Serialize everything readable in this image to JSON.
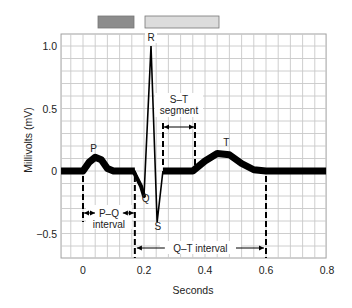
{
  "chart_data": {
    "type": "line",
    "title": "",
    "xlabel": "Seconds",
    "ylabel": "Millivolts (mV)",
    "xlim": [
      -0.072,
      0.797
    ],
    "ylim": [
      -0.696,
      1.096
    ],
    "grid": true,
    "x_ticks": [
      {
        "value": 0,
        "label": "0"
      },
      {
        "value": 0.2,
        "label": "0.2"
      },
      {
        "value": 0.4,
        "label": "0.4"
      },
      {
        "value": 0.6,
        "label": "0.6"
      },
      {
        "value": 0.8,
        "label": "0.8"
      }
    ],
    "y_ticks": [
      {
        "value": 1.0,
        "label": "1.0"
      },
      {
        "value": 0.5,
        "label": "0.5"
      },
      {
        "value": 0,
        "label": "0"
      },
      {
        "value": -0.5,
        "label": "−0.5"
      }
    ],
    "series": [
      {
        "name": "ECG trace",
        "x": [
          -0.072,
          0.0,
          0.02,
          0.04,
          0.06,
          0.08,
          0.1,
          0.17,
          0.2,
          0.223,
          0.243,
          0.262,
          0.27,
          0.36,
          0.4,
          0.44,
          0.48,
          0.52,
          0.56,
          0.6,
          0.797
        ],
        "y": [
          0,
          0,
          0.07,
          0.11,
          0.09,
          0.02,
          0,
          0,
          -0.2,
          1.0,
          -0.41,
          0,
          0,
          0,
          0.08,
          0.14,
          0.13,
          0.06,
          0.01,
          0,
          0
        ]
      }
    ],
    "wave_labels": [
      {
        "label": "P",
        "x": 0.035,
        "y": 0.15
      },
      {
        "label": "Q",
        "x": 0.205,
        "y": -0.25
      },
      {
        "label": "R",
        "x": 0.223,
        "y": 1.04
      },
      {
        "label": "S",
        "x": 0.245,
        "y": -0.47
      },
      {
        "label": "T",
        "x": 0.47,
        "y": 0.2
      }
    ],
    "annotations": [
      {
        "label": "P–Q interval",
        "line1": "P–Q",
        "line2": "interval",
        "start": 0.0,
        "end": 0.17
      },
      {
        "label": "S–T segment",
        "line1": "S–T",
        "line2": "segment",
        "start": 0.262,
        "end": 0.365
      },
      {
        "label": "Q–T interval",
        "line1": "Q–T interval",
        "start": 0.17,
        "end": 0.6
      }
    ],
    "legend_swatches": [
      {
        "name": "dark-swatch",
        "color": "#8c8c8c"
      },
      {
        "name": "light-swatch",
        "color": "#dcdcdc"
      }
    ]
  },
  "colors": {
    "trace": "#000000",
    "grid": "#c8c8c8",
    "frame": "#a0a0a0"
  }
}
